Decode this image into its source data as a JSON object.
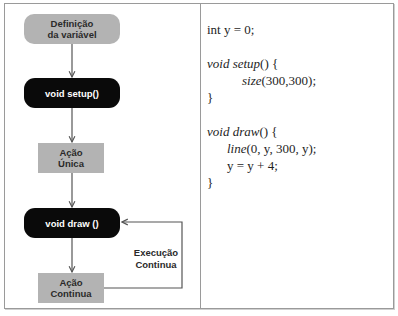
{
  "diagram": {
    "nodes": [
      {
        "id": "definicao",
        "line1": "Definição",
        "line2": "da variável",
        "style": "grey-round"
      },
      {
        "id": "setup",
        "label": "void setup()",
        "style": "black-round"
      },
      {
        "id": "acao-unica",
        "line1": "Ação",
        "line2": "Única",
        "style": "grey-rect"
      },
      {
        "id": "draw",
        "label": "void draw ()",
        "style": "black-round"
      },
      {
        "id": "acao-continua",
        "line1": "Ação",
        "line2": "Continua",
        "style": "grey-rect"
      }
    ],
    "loop_label": {
      "line1": "Execução",
      "line2": "Continua"
    },
    "colors": {
      "grey": "#b3b3b3",
      "black": "#0a0a0a",
      "line": "#555555"
    }
  },
  "code": {
    "lines": [
      {
        "parts": [
          {
            "t": "int y = 0;",
            "i": false
          }
        ]
      },
      {
        "parts": []
      },
      {
        "parts": [
          {
            "t": "void setup",
            "i": true
          },
          {
            "t": "() {",
            "i": false
          }
        ]
      },
      {
        "indent": 2,
        "parts": [
          {
            "t": "size",
            "i": true
          },
          {
            "t": "(300,300);",
            "i": false
          }
        ]
      },
      {
        "parts": [
          {
            "t": "}",
            "i": false
          }
        ]
      },
      {
        "parts": []
      },
      {
        "parts": [
          {
            "t": "void draw",
            "i": true
          },
          {
            "t": "() {",
            "i": false
          }
        ]
      },
      {
        "indent": 1,
        "parts": [
          {
            "t": "line",
            "i": true
          },
          {
            "t": "(0, y, 300, y);",
            "i": false
          }
        ]
      },
      {
        "indent": 1,
        "parts": [
          {
            "t": "y = y + 4;",
            "i": false
          }
        ]
      },
      {
        "parts": [
          {
            "t": "}",
            "i": false
          }
        ]
      }
    ]
  }
}
